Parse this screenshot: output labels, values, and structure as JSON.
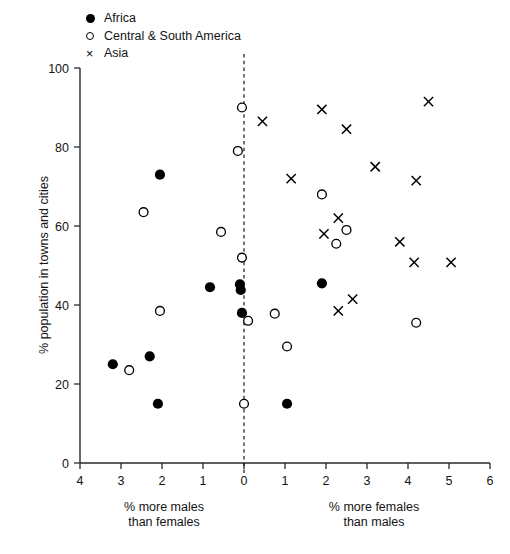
{
  "chart_data": {
    "type": "scatter",
    "title": "",
    "xlabel_left": "% more males\nthan females",
    "xlabel_right": "% more females\nthan males",
    "ylabel": "% population in towns and cities",
    "xlim": [
      -4,
      6
    ],
    "ylim": [
      0,
      100
    ],
    "x_tick_values": [
      -4,
      -3,
      -2,
      -1,
      0,
      1,
      2,
      3,
      4,
      5,
      6
    ],
    "x_tick_labels": [
      "4",
      "3",
      "2",
      "1",
      "0",
      "1",
      "2",
      "3",
      "4",
      "5",
      "6"
    ],
    "y_tick_values": [
      0,
      20,
      40,
      60,
      80,
      100
    ],
    "y_tick_labels": [
      "0",
      "20",
      "40",
      "60",
      "80",
      "100"
    ],
    "grid": false,
    "reference_line": {
      "axis": "x",
      "value": 0,
      "style": "dashed"
    },
    "legend_position": "top-left",
    "series": [
      {
        "name": "Africa",
        "marker": "filled-circle",
        "color": "#000000",
        "points": [
          [
            -3.2,
            25.0
          ],
          [
            -2.3,
            27.0
          ],
          [
            -2.05,
            73.0
          ],
          [
            -2.1,
            15.0
          ],
          [
            -0.83,
            44.5
          ],
          [
            -0.1,
            45.2
          ],
          [
            -0.08,
            43.8
          ],
          [
            -0.05,
            38.0
          ],
          [
            1.05,
            15.0
          ],
          [
            1.9,
            45.5
          ]
        ]
      },
      {
        "name": "Central & South America",
        "marker": "open-circle",
        "color": "#000000",
        "points": [
          [
            -2.8,
            23.5
          ],
          [
            -2.45,
            63.5
          ],
          [
            -2.05,
            38.5
          ],
          [
            -0.56,
            58.5
          ],
          [
            -0.15,
            79.0
          ],
          [
            -0.05,
            90.0
          ],
          [
            -0.05,
            52.0
          ],
          [
            0.0,
            15.0
          ],
          [
            0.1,
            36.0
          ],
          [
            0.75,
            37.8
          ],
          [
            1.05,
            29.5
          ],
          [
            1.9,
            68.0
          ],
          [
            2.25,
            55.5
          ],
          [
            2.5,
            59.0
          ],
          [
            4.2,
            35.5
          ]
        ]
      },
      {
        "name": "Asia",
        "marker": "cross",
        "color": "#000000",
        "points": [
          [
            0.45,
            86.5
          ],
          [
            1.15,
            72.0
          ],
          [
            1.9,
            89.5
          ],
          [
            1.95,
            58.0
          ],
          [
            2.3,
            62.0
          ],
          [
            2.3,
            38.5
          ],
          [
            2.5,
            84.5
          ],
          [
            2.65,
            41.5
          ],
          [
            3.2,
            75.0
          ],
          [
            3.8,
            56.0
          ],
          [
            4.15,
            50.8
          ],
          [
            4.2,
            71.5
          ],
          [
            4.5,
            91.5
          ],
          [
            5.05,
            50.8
          ]
        ]
      }
    ]
  },
  "legend": {
    "items": [
      {
        "label": "Africa",
        "marker": "filled-circle"
      },
      {
        "label": "Central & South America",
        "marker": "open-circle"
      },
      {
        "label": "Asia",
        "marker": "cross"
      }
    ]
  },
  "axes": {
    "y_title": "% population in towns and cities",
    "x_caption_left_line1": "% more males",
    "x_caption_left_line2": "than females",
    "x_caption_right_line1": "% more females",
    "x_caption_right_line2": "than males"
  }
}
